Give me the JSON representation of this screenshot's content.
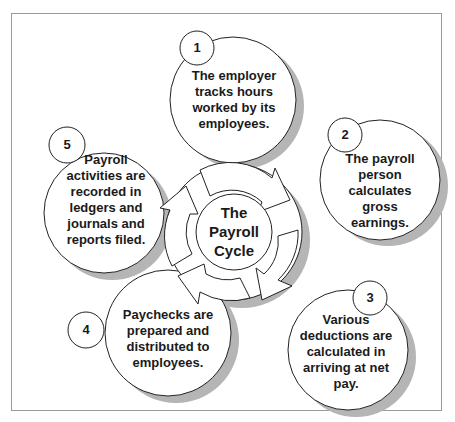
{
  "diagram": {
    "center_label": [
      "The",
      "Payroll",
      "Cycle"
    ],
    "steps": [
      {
        "number": "1",
        "lines": [
          "The employer",
          "tracks hours",
          "worked by its",
          "employees."
        ]
      },
      {
        "number": "2",
        "lines": [
          "The payroll",
          "person",
          "calculates",
          "gross",
          "earnings."
        ]
      },
      {
        "number": "3",
        "lines": [
          "Various",
          "deductions are",
          "calculated in",
          "arriving at net",
          "pay."
        ]
      },
      {
        "number": "4",
        "lines": [
          "Paychecks are",
          "prepared and",
          "distributed to",
          "employees."
        ]
      },
      {
        "number": "5",
        "lines": [
          "Payroll",
          "activities are",
          "recorded in",
          "ledgers and",
          "journals and",
          "reports filed."
        ]
      }
    ],
    "colors": {
      "stroke": "#222222",
      "shadow": "#b3b3b3",
      "fill": "#ffffff",
      "frame": "#9a9a9a"
    }
  }
}
